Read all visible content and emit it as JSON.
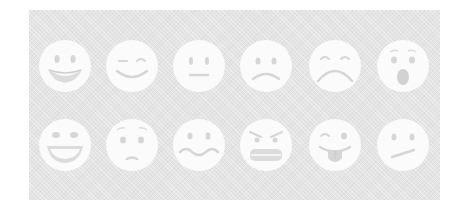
{
  "panel": {
    "background": "#e4e4e4",
    "face_color": "#fbfbfb",
    "feature_color": "#d6d6d6"
  },
  "faces": [
    {
      "name": "grinning-face",
      "row": 1,
      "col": 1,
      "cx": 65,
      "cy": 66
    },
    {
      "name": "smiling-closed-eyes-face",
      "row": 1,
      "col": 2,
      "cx": 132,
      "cy": 66
    },
    {
      "name": "neutral-face",
      "row": 1,
      "col": 3,
      "cx": 199,
      "cy": 66
    },
    {
      "name": "frowning-face",
      "row": 1,
      "col": 4,
      "cx": 266,
      "cy": 66
    },
    {
      "name": "sad-closed-eyes-face",
      "row": 1,
      "col": 5,
      "cx": 335,
      "cy": 66
    },
    {
      "name": "astonished-face",
      "row": 1,
      "col": 6,
      "cx": 403,
      "cy": 66
    },
    {
      "name": "laughing-face",
      "row": 2,
      "col": 1,
      "cx": 65,
      "cy": 145
    },
    {
      "name": "worried-face",
      "row": 2,
      "col": 2,
      "cx": 132,
      "cy": 145
    },
    {
      "name": "confounded-wavy-mouth-face",
      "row": 2,
      "col": 3,
      "cx": 199,
      "cy": 145
    },
    {
      "name": "angry-grimacing-face",
      "row": 2,
      "col": 4,
      "cx": 266,
      "cy": 145
    },
    {
      "name": "winking-tongue-face",
      "row": 2,
      "col": 5,
      "cx": 335,
      "cy": 145
    },
    {
      "name": "confused-face",
      "row": 2,
      "col": 6,
      "cx": 403,
      "cy": 145
    }
  ]
}
